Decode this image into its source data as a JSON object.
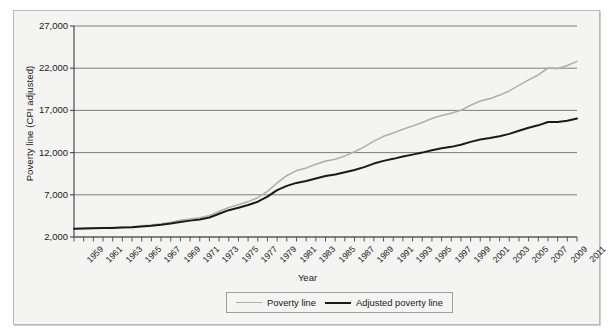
{
  "chart_data": {
    "type": "line",
    "title": "",
    "xlabel": "Year",
    "ylabel": "Poverty line (CPI adjusted)",
    "ylim": [
      2000,
      27000
    ],
    "yticks": [
      "2,000",
      "7,000",
      "12,000",
      "17,000",
      "22,000",
      "27,000"
    ],
    "ytick_values": [
      2000,
      7000,
      12000,
      17000,
      22000,
      27000
    ],
    "xlim": [
      1959,
      2011
    ],
    "grid": true,
    "legend_position": "bottom-center",
    "xtick_labels": [
      "1959",
      "1961",
      "1963",
      "1965",
      "1967",
      "1969",
      "1971",
      "1973",
      "1975",
      "1977",
      "1979",
      "1981",
      "1983",
      "1985",
      "1987",
      "1989",
      "1991",
      "1993",
      "1995",
      "1997",
      "1999",
      "2001",
      "2003",
      "2005",
      "2007",
      "2009",
      "2011"
    ],
    "x": [
      1959,
      1960,
      1961,
      1962,
      1963,
      1964,
      1965,
      1966,
      1967,
      1968,
      1969,
      1970,
      1971,
      1972,
      1973,
      1974,
      1975,
      1976,
      1977,
      1978,
      1979,
      1980,
      1981,
      1982,
      1983,
      1984,
      1985,
      1986,
      1987,
      1988,
      1989,
      1990,
      1991,
      1992,
      1993,
      1994,
      1995,
      1996,
      1997,
      1998,
      1999,
      2000,
      2001,
      2002,
      2003,
      2004,
      2005,
      2006,
      2007,
      2008,
      2009,
      2010,
      2011
    ],
    "series": [
      {
        "name": "Poverty line",
        "color": "#b0b0b0",
        "values": [
          2973,
          3022,
          3054,
          3089,
          3128,
          3169,
          3223,
          3317,
          3410,
          3553,
          3743,
          3968,
          4137,
          4275,
          4540,
          5038,
          5500,
          5815,
          6191,
          6662,
          7412,
          8414,
          9287,
          9862,
          10178,
          10609,
          10989,
          11203,
          11611,
          12092,
          12674,
          13359,
          13924,
          14335,
          14763,
          15141,
          15569,
          16036,
          16400,
          16660,
          17029,
          17603,
          18104,
          18392,
          18810,
          19307,
          19971,
          20614,
          21203,
          22025,
          21954,
          22314,
          22811
        ]
      },
      {
        "name": "Adjusted poverty line",
        "color": "#1a1a1a",
        "values": [
          2973,
          3005,
          3030,
          3055,
          3080,
          3120,
          3170,
          3250,
          3330,
          3450,
          3600,
          3790,
          3940,
          4070,
          4310,
          4760,
          5180,
          5460,
          5790,
          6180,
          6790,
          7560,
          8060,
          8410,
          8630,
          8930,
          9220,
          9400,
          9660,
          9940,
          10280,
          10700,
          11020,
          11260,
          11530,
          11760,
          12000,
          12280,
          12510,
          12680,
          12930,
          13270,
          13560,
          13720,
          13940,
          14220,
          14590,
          14940,
          15230,
          15630,
          15620,
          15780,
          16030
        ]
      }
    ],
    "series_display": [
      {
        "name": "Poverty line",
        "note": "light gray upper line, ends just above 22,000"
      },
      {
        "name": "Adjusted poverty line",
        "note": "dark line, ends near 13,600"
      }
    ]
  },
  "legend": {
    "items": [
      {
        "label": "Poverty line"
      },
      {
        "label": "Adjusted poverty line"
      }
    ]
  }
}
